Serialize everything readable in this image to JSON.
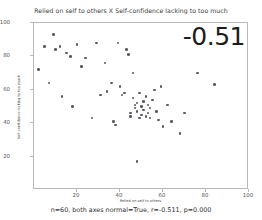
{
  "chart_data": {
    "type": "scatter",
    "title": "Relied on self to others X Self-confidence lacking to too much",
    "xlabel": "Relied on self to others",
    "ylabel": "Self-confidence lacking to too much",
    "xlim": [
      0,
      100
    ],
    "ylim": [
      0,
      100
    ],
    "xticks": [
      20,
      40,
      60,
      80,
      100
    ],
    "yticks": [
      20,
      40,
      60,
      80,
      100
    ],
    "grid": false,
    "legend": null,
    "annotation": "-0.51",
    "caption": "n=60, both axes normal=True, r=-0.511, p=0.000",
    "n": 60,
    "r": -0.511,
    "p": 0.0,
    "marker_color": "#5a5a62",
    "points": [
      {
        "x": 2,
        "y": 72
      },
      {
        "x": 5,
        "y": 86
      },
      {
        "x": 7,
        "y": 64
      },
      {
        "x": 9,
        "y": 93
      },
      {
        "x": 10,
        "y": 84
      },
      {
        "x": 12,
        "y": 86
      },
      {
        "x": 13,
        "y": 56
      },
      {
        "x": 15,
        "y": 82
      },
      {
        "x": 17,
        "y": 80
      },
      {
        "x": 18,
        "y": 50
      },
      {
        "x": 20,
        "y": 87
      },
      {
        "x": 22,
        "y": 74
      },
      {
        "x": 24,
        "y": 79
      },
      {
        "x": 27,
        "y": 43
      },
      {
        "x": 29,
        "y": 88
      },
      {
        "x": 31,
        "y": 57
      },
      {
        "x": 33,
        "y": 76
      },
      {
        "x": 34,
        "y": 59
      },
      {
        "x": 36,
        "y": 64
      },
      {
        "x": 37,
        "y": 41
      },
      {
        "x": 38,
        "y": 39
      },
      {
        "x": 39,
        "y": 88
      },
      {
        "x": 40,
        "y": 62
      },
      {
        "x": 41,
        "y": 57
      },
      {
        "x": 42,
        "y": 58
      },
      {
        "x": 43,
        "y": 84
      },
      {
        "x": 44,
        "y": 81
      },
      {
        "x": 45,
        "y": 46
      },
      {
        "x": 45,
        "y": 44
      },
      {
        "x": 46,
        "y": 70
      },
      {
        "x": 46,
        "y": 55
      },
      {
        "x": 47,
        "y": 51
      },
      {
        "x": 47,
        "y": 49
      },
      {
        "x": 48,
        "y": 52
      },
      {
        "x": 48,
        "y": 47
      },
      {
        "x": 49,
        "y": 58
      },
      {
        "x": 49,
        "y": 43
      },
      {
        "x": 50,
        "y": 50
      },
      {
        "x": 50,
        "y": 45
      },
      {
        "x": 51,
        "y": 53
      },
      {
        "x": 51,
        "y": 48
      },
      {
        "x": 52,
        "y": 44
      },
      {
        "x": 52,
        "y": 56
      },
      {
        "x": 53,
        "y": 51
      },
      {
        "x": 53,
        "y": 46
      },
      {
        "x": 54,
        "y": 49
      },
      {
        "x": 54,
        "y": 43
      },
      {
        "x": 55,
        "y": 54
      },
      {
        "x": 56,
        "y": 60
      },
      {
        "x": 57,
        "y": 47
      },
      {
        "x": 58,
        "y": 42
      },
      {
        "x": 59,
        "y": 62
      },
      {
        "x": 60,
        "y": 38
      },
      {
        "x": 62,
        "y": 51
      },
      {
        "x": 64,
        "y": 41
      },
      {
        "x": 68,
        "y": 34
      },
      {
        "x": 70,
        "y": 46
      },
      {
        "x": 76,
        "y": 70
      },
      {
        "x": 84,
        "y": 63
      },
      {
        "x": 48,
        "y": 17
      }
    ]
  },
  "figure": {
    "background": "#ffffff",
    "frame_color": "#b8b8b8"
  }
}
